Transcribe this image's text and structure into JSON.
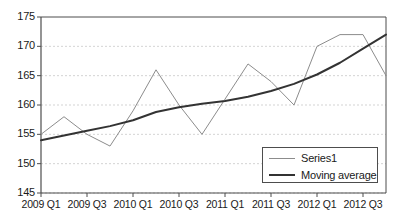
{
  "chart_data": {
    "type": "line",
    "title": "",
    "xlabel": "",
    "ylabel": "",
    "ylim": [
      145,
      175
    ],
    "yticks": [
      145,
      150,
      155,
      160,
      165,
      170,
      175
    ],
    "grid": true,
    "legend_position": "bottom-right",
    "x": [
      "2009 Q1",
      "2009 Q2",
      "2009 Q3",
      "2009 Q4",
      "2010 Q1",
      "2010 Q2",
      "2010 Q3",
      "2010 Q4",
      "2011 Q1",
      "2011 Q2",
      "2011 Q3",
      "2011 Q4",
      "2012 Q1",
      "2012 Q2",
      "2012 Q3",
      "2012 Q4"
    ],
    "xtick_labels": [
      "2009 Q1",
      "2009 Q3",
      "2010 Q1",
      "2010 Q3",
      "2011 Q1",
      "2011 Q3",
      "2012 Q1",
      "2012 Q3"
    ],
    "xtick_indices": [
      0,
      2,
      4,
      6,
      8,
      10,
      12,
      14
    ],
    "series": [
      {
        "name": "Series1",
        "color": "#8c8c8c",
        "width": 1,
        "values": [
          155,
          158,
          155,
          153,
          159,
          166,
          160,
          155,
          161,
          167,
          164,
          160,
          170,
          172,
          172,
          165
        ]
      },
      {
        "name": "Moving average",
        "color": "#333333",
        "width": 2,
        "values": [
          154.0,
          154.8,
          155.6,
          156.4,
          157.4,
          158.8,
          159.6,
          160.2,
          160.7,
          161.4,
          162.4,
          163.6,
          165.2,
          167.2,
          169.6,
          172.0
        ]
      }
    ]
  },
  "legend": {
    "entries": [
      {
        "label": "Series1"
      },
      {
        "label": "Moving average"
      }
    ]
  },
  "axes": {
    "y_label_145": "145",
    "y_label_150": "150",
    "y_label_155": "155",
    "y_label_160": "160",
    "y_label_165": "165",
    "y_label_170": "170",
    "y_label_175": "175"
  },
  "colors": {
    "series1": "#8c8c8c",
    "moving_average": "#333333",
    "grid": "#c8c8c8",
    "axis": "#4d4d4d",
    "text": "#1a1a1a",
    "background": "#ffffff"
  }
}
